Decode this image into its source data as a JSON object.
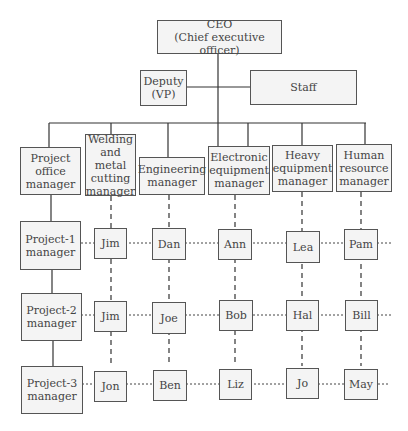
{
  "top": {
    "ceo": "CEO\n(Chief executive officer)",
    "deputy": "Deputy\n(VP)",
    "staff": "Staff"
  },
  "row_header": "Project office\nmanager",
  "functional_managers": [
    "Welding\nand metal\ncutting\nmanager",
    "Engineering\nmanager",
    "Electronic\nequipment\nmanager",
    "Heavy\nequipment\nmanager",
    "Human\nresource\nmanager"
  ],
  "projects": [
    {
      "label": "Project-1\nmanager",
      "staff": [
        "Jim",
        "Dan",
        "Ann",
        "Lea",
        "Pam"
      ]
    },
    {
      "label": "Project-2\nmanager",
      "staff": [
        "Jim",
        "Joe",
        "Bob",
        "Hal",
        "Bill"
      ]
    },
    {
      "label": "Project-3\nmanager",
      "staff": [
        "Jon",
        "Ben",
        "Liz",
        "Jo",
        "May"
      ]
    }
  ]
}
